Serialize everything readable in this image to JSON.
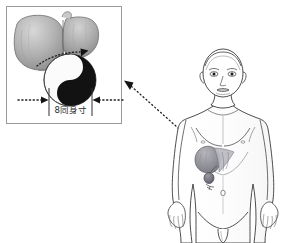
{
  "illustration": {
    "title": "Liver position and yin-yang proportional measurement diagram",
    "background_color": "#ffffff",
    "inset_panel": {
      "name": "detail-box",
      "border_color": "#9a9a9a",
      "x": 6,
      "y": 6,
      "width": 116,
      "height": 118,
      "contents": [
        {
          "name": "liver-organ",
          "label": "liver",
          "fill_color": "#a8a8a8"
        },
        {
          "name": "yin-yang-symbol",
          "label": "yin-yang",
          "dark_color": "#111111",
          "light_color": "#f7f7f7"
        },
        {
          "name": "curved-dotted-arrow",
          "label": "liver-to-yinyang pointer"
        }
      ]
    },
    "dimension": {
      "name": "measurement-span",
      "label": "8同身寸",
      "left_arrow": "arrow-right-icon",
      "right_arrow": "arrow-left-icon",
      "tick_color": "#333333"
    },
    "body_figure": {
      "name": "human-body-front-view",
      "outline_color": "#3a3a3a",
      "organ_overlay": {
        "name": "liver-and-gallbladder-overlay",
        "fill_color": "#8e8e93"
      }
    },
    "connector": {
      "name": "dotted-connector-arrow",
      "from": "body-liver-region",
      "to": "detail-box-right-edge",
      "style": "dotted",
      "color": "#2e2e2e"
    }
  }
}
